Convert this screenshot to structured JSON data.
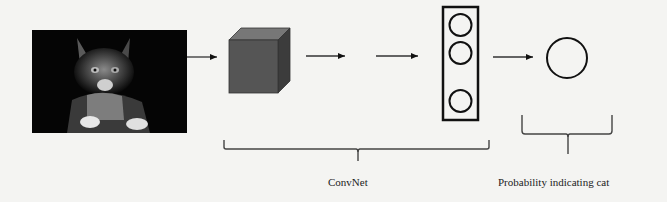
{
  "diagram": {
    "input_image": {
      "subject": "cat photo",
      "description": "grayscale photo of a tabby cat on black background"
    },
    "nodes": [
      {
        "id": "input",
        "type": "image"
      },
      {
        "id": "conv_volume",
        "type": "cube"
      },
      {
        "id": "fc_layer",
        "type": "vertical-box-with-3-circles",
        "circle_count": 3
      },
      {
        "id": "output",
        "type": "circle"
      }
    ],
    "edges": [
      {
        "from": "input",
        "to": "conv_volume"
      },
      {
        "from": "conv_volume",
        "to": "gap"
      },
      {
        "from": "gap",
        "to": "fc_layer"
      },
      {
        "from": "fc_layer",
        "to": "output"
      }
    ],
    "braces": [
      {
        "label": "ConvNet",
        "spans": [
          "conv_volume",
          "fc_layer"
        ]
      },
      {
        "label": "Probability indicating cat",
        "spans": [
          "output"
        ]
      }
    ],
    "colors": {
      "background": "#f4f4f2",
      "stroke": "#111111",
      "cube_front": "#555555",
      "cube_top": "#777777",
      "cube_side": "#3c3c3c"
    }
  }
}
